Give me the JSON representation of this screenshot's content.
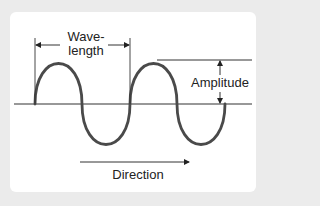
{
  "diagram": {
    "title": "",
    "labels": {
      "wavelength_line1": "Wave-",
      "wavelength_line2": "length",
      "amplitude": "Amplitude",
      "direction": "Direction"
    },
    "colors": {
      "frame": "#ebebeb",
      "panel": "#ffffff",
      "wave": "#4a4a4a",
      "lines": "#333333",
      "text": "#222222"
    },
    "elements": [
      {
        "id": "axis",
        "type": "horizontal-line",
        "description": "Baseline / rest position"
      },
      {
        "id": "wave",
        "type": "sine-wave",
        "cycles": 2.5,
        "description": "Transverse wave starting at baseline going up"
      },
      {
        "id": "wavelength",
        "type": "dimension-arrow",
        "description": "Double arrow between two crests' starting points"
      },
      {
        "id": "amplitude",
        "type": "dimension-arrow",
        "description": "Vertical double arrow from baseline to crest line"
      },
      {
        "id": "direction",
        "type": "arrow",
        "description": "Arrow pointing right indicating propagation direction"
      }
    ]
  }
}
